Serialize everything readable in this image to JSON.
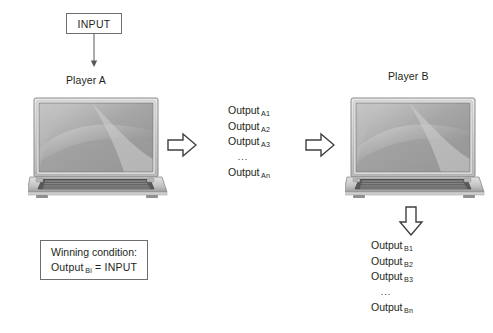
{
  "diagram": {
    "title_input": "INPUT",
    "players": [
      {
        "id": "a",
        "label": "Player A",
        "device_icon": "laptop-icon"
      },
      {
        "id": "b",
        "label": "Player B",
        "device_icon": "laptop-icon"
      }
    ],
    "arrows": [
      {
        "name": "input-to-player-a-arrow",
        "direction": "down",
        "style": "thin-line"
      },
      {
        "name": "player-a-to-outputs-arrow",
        "direction": "right",
        "style": "block"
      },
      {
        "name": "outputs-to-player-b-arrow",
        "direction": "right",
        "style": "block"
      },
      {
        "name": "player-b-to-outputs-arrow",
        "direction": "down",
        "style": "block"
      }
    ],
    "output_list_a": {
      "name": "output-list-a",
      "rows": [
        {
          "text": "Output",
          "subscript": "A1"
        },
        {
          "text": "Output",
          "subscript": "A2"
        },
        {
          "text": "Output",
          "subscript": "A3"
        },
        {
          "text": "...",
          "subscript": ""
        },
        {
          "text": "Output",
          "subscript": "An"
        }
      ]
    },
    "output_list_b": {
      "name": "output-list-b",
      "rows": [
        {
          "text": "Output",
          "subscript": "B1"
        },
        {
          "text": "Output",
          "subscript": "B2"
        },
        {
          "text": "Output",
          "subscript": "B3"
        },
        {
          "text": "...",
          "subscript": ""
        },
        {
          "text": "Output",
          "subscript": "Bn"
        }
      ]
    },
    "winning_condition": {
      "line1": "Winning condition:",
      "line2_prefix": "Output",
      "line2_subscript": "Bi",
      "line2_suffix": "=  INPUT"
    },
    "colors": {
      "background": "#ffffff",
      "text": "#231f20",
      "box_border": "#6d6e70",
      "arrow_outline": "#3f3f3f",
      "arrow_fill": "#ffffff",
      "laptop_dark": "#4a4a4a",
      "laptop_mid": "#9a9a9a",
      "laptop_light": "#d8d8d8"
    }
  }
}
